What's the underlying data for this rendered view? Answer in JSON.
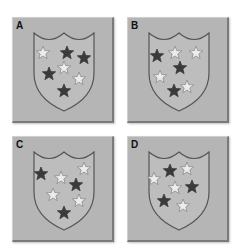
{
  "colors": {
    "panel_bg": "#b5b5b5",
    "shield_fill": "#bdbdbd",
    "shield_stroke": "#555555",
    "dark_star": "#3a3a3a",
    "light_star": "#ececec",
    "light_star_stroke": "#8a8a8a"
  },
  "panels": [
    {
      "label": "A",
      "stars": [
        {
          "x": 30,
          "y": 35,
          "color": "light"
        },
        {
          "x": 54,
          "y": 35,
          "color": "dark"
        },
        {
          "x": 71,
          "y": 40,
          "color": "dark"
        },
        {
          "x": 51,
          "y": 50,
          "color": "light"
        },
        {
          "x": 36,
          "y": 56,
          "color": "dark"
        },
        {
          "x": 66,
          "y": 61,
          "color": "light"
        },
        {
          "x": 51,
          "y": 73,
          "color": "dark"
        }
      ]
    },
    {
      "label": "B",
      "stars": [
        {
          "x": 29,
          "y": 38,
          "color": "dark"
        },
        {
          "x": 47,
          "y": 35,
          "color": "light"
        },
        {
          "x": 68,
          "y": 35,
          "color": "light"
        },
        {
          "x": 52,
          "y": 50,
          "color": "dark"
        },
        {
          "x": 32,
          "y": 59,
          "color": "light"
        },
        {
          "x": 59,
          "y": 69,
          "color": "light"
        },
        {
          "x": 46,
          "y": 73,
          "color": "dark"
        }
      ]
    },
    {
      "label": "C",
      "stars": [
        {
          "x": 71,
          "y": 32,
          "color": "light"
        },
        {
          "x": 28,
          "y": 37,
          "color": "dark"
        },
        {
          "x": 48,
          "y": 41,
          "color": "light"
        },
        {
          "x": 63,
          "y": 48,
          "color": "dark"
        },
        {
          "x": 40,
          "y": 58,
          "color": "light"
        },
        {
          "x": 66,
          "y": 64,
          "color": "light"
        },
        {
          "x": 51,
          "y": 76,
          "color": "dark"
        }
      ]
    },
    {
      "label": "D",
      "stars": [
        {
          "x": 42,
          "y": 34,
          "color": "dark"
        },
        {
          "x": 59,
          "y": 32,
          "color": "light"
        },
        {
          "x": 26,
          "y": 42,
          "color": "light"
        },
        {
          "x": 47,
          "y": 51,
          "color": "light"
        },
        {
          "x": 64,
          "y": 50,
          "color": "dark"
        },
        {
          "x": 36,
          "y": 64,
          "color": "dark"
        },
        {
          "x": 55,
          "y": 69,
          "color": "light"
        }
      ]
    }
  ]
}
